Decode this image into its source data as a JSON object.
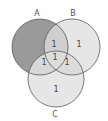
{
  "diagram": {
    "type": "venn",
    "sets": [
      {
        "name": "A",
        "cx": 40,
        "cy": 47,
        "r": 28,
        "label_x": 37,
        "label_y": 16
      },
      {
        "name": "B",
        "cx": 72,
        "cy": 47,
        "r": 28,
        "label_x": 73,
        "label_y": 16
      },
      {
        "name": "C",
        "cx": 56,
        "cy": 79,
        "r": 28,
        "label_x": 55,
        "label_y": 117
      }
    ],
    "regions": [
      {
        "id": "a_only",
        "value": "",
        "shaded": true,
        "x": 28,
        "y": 50
      },
      {
        "id": "b_only",
        "value": "1",
        "x": 79,
        "y": 47
      },
      {
        "id": "c_only",
        "value": "1",
        "x": 56,
        "y": 92
      },
      {
        "id": "a_and_b",
        "value": "1",
        "x": 54,
        "y": 47
      },
      {
        "id": "a_and_c",
        "value": "1",
        "x": 44,
        "y": 65
      },
      {
        "id": "b_and_c",
        "value": "1",
        "x": 67,
        "y": 65
      },
      {
        "id": "a_and_b_and_c",
        "value": "1",
        "x": 55,
        "y": 60
      }
    ],
    "colors": {
      "a_only_fill": "#9a9a9a",
      "base_fill": "#e6e6e6",
      "overlap_fill": "#cfcfcf",
      "stroke": "#5a5a5a"
    }
  }
}
